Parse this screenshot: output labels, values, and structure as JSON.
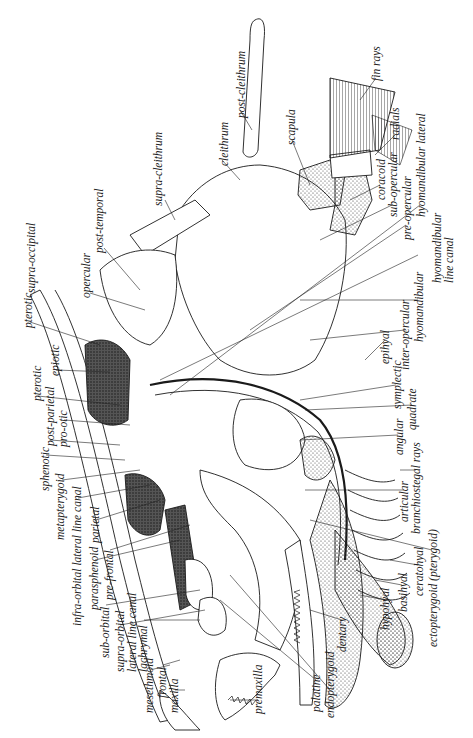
{
  "figure": {
    "ink_color": "#1a1a1a",
    "background": "#ffffff"
  },
  "labels": [
    {
      "id": "post-cleithrum",
      "text": "post-cleithrum",
      "x": 236,
      "y": 118
    },
    {
      "id": "cleithrum",
      "text": "cleithrum",
      "x": 219,
      "y": 166
    },
    {
      "id": "supra-cleithrum",
      "text": "supra-cleithrum",
      "x": 162,
      "y": 206
    },
    {
      "id": "post-temporal",
      "text": "post-temporal",
      "x": 100,
      "y": 253
    },
    {
      "id": "supra-occipital",
      "text": "supra-occipital",
      "x": 33,
      "y": 293
    },
    {
      "id": "opercular",
      "text": "opercular",
      "x": 86,
      "y": 298
    },
    {
      "id": "pterotic-upper",
      "text": "pterotic",
      "x": 25,
      "y": 328
    },
    {
      "id": "epiotic",
      "text": "epiotic",
      "x": 52,
      "y": 376
    },
    {
      "id": "pterotic-lower",
      "text": "pterotic",
      "x": 34,
      "y": 401
    },
    {
      "id": "post-parietal",
      "text": "post-parietal",
      "x": 47,
      "y": 446
    },
    {
      "id": "pro-otic",
      "text": "pro-otic",
      "x": 60,
      "y": 447
    },
    {
      "id": "sphenotic",
      "text": "sphenotic",
      "x": 42,
      "y": 491
    },
    {
      "id": "metapterygoid",
      "text": "metapterygoid",
      "x": 57,
      "y": 540
    },
    {
      "id": "infra-orbital-lateral-line-canal",
      "text": "infra-orbital lateral line canal",
      "x": 74,
      "y": 626
    },
    {
      "id": "parietal",
      "text": "parietal",
      "x": 92,
      "y": 543
    },
    {
      "id": "parasphenoid",
      "text": "parasphenoid",
      "x": 91,
      "y": 610
    },
    {
      "id": "pre-frontal",
      "text": "pre-frontal",
      "x": 106,
      "y": 600
    },
    {
      "id": "sub-orbital",
      "text": "sub-orbital",
      "x": 102,
      "y": 658
    },
    {
      "id": "supra-orbital-lateral-line-canal",
      "text": "supra-orbital\nlateral line canal",
      "x": 116,
      "y": 672
    },
    {
      "id": "lachrymal",
      "text": "lachrymal",
      "x": 140,
      "y": 672
    },
    {
      "id": "mesethmoid",
      "text": "mesethmoid",
      "x": 146,
      "y": 713
    },
    {
      "id": "frontal",
      "text": "frontal",
      "x": 159,
      "y": 698
    },
    {
      "id": "maxilla",
      "text": "maxilla",
      "x": 171,
      "y": 713
    },
    {
      "id": "premaxilla",
      "text": "premaxilla",
      "x": 255,
      "y": 714
    },
    {
      "id": "palatine",
      "text": "palatine",
      "x": 313,
      "y": 712
    },
    {
      "id": "endopterygoid",
      "text": "endopterygoid",
      "x": 327,
      "y": 718
    },
    {
      "id": "dentary",
      "text": "dentary",
      "x": 339,
      "y": 652
    },
    {
      "id": "hypohyal",
      "text": "hypohyal",
      "x": 382,
      "y": 630
    },
    {
      "id": "basihyal",
      "text": "basihyal",
      "x": 400,
      "y": 612
    },
    {
      "id": "ceratohyal",
      "text": "ceratohyal",
      "x": 416,
      "y": 596
    },
    {
      "id": "ectopterygoid-pterygoid",
      "text": "ectopterygoid (pterygoid)",
      "x": 430,
      "y": 647
    },
    {
      "id": "articular",
      "text": "articular",
      "x": 401,
      "y": 522
    },
    {
      "id": "branchiostegal-rays",
      "text": "branchiostegal rays",
      "x": 413,
      "y": 534
    },
    {
      "id": "angular",
      "text": "angular",
      "x": 396,
      "y": 455
    },
    {
      "id": "quadrate",
      "text": "quadrate",
      "x": 409,
      "y": 430
    },
    {
      "id": "symplectic",
      "text": "symplectic",
      "x": 394,
      "y": 409
    },
    {
      "id": "epihyal",
      "text": "epihyal",
      "x": 382,
      "y": 364
    },
    {
      "id": "inter-opercular",
      "text": "inter-opercular",
      "x": 402,
      "y": 370
    },
    {
      "id": "hyomandibular",
      "text": "hyomandibular",
      "x": 416,
      "y": 342
    },
    {
      "id": "hyomandibular-line-canal",
      "text": "hyomandibular\nline canal",
      "x": 416,
      "y": 283
    },
    {
      "id": "pre-opercular-hyomandibular-lateral",
      "text": "pre-opercular",
      "x": 404,
      "y": 240
    },
    {
      "id": "hyomandibular-lateral",
      "text": "hyomandibular lateral",
      "x": 418,
      "y": 217
    },
    {
      "id": "sub-opercular",
      "text": "sub-opercular",
      "x": 390,
      "y": 217
    },
    {
      "id": "coracoid",
      "text": "coracoid",
      "x": 378,
      "y": 200
    },
    {
      "id": "scapula",
      "text": "scapula",
      "x": 288,
      "y": 145
    },
    {
      "id": "radials",
      "text": "radials",
      "x": 392,
      "y": 140
    },
    {
      "id": "fin-rays",
      "text": "fin rays",
      "x": 373,
      "y": 81
    }
  ]
}
